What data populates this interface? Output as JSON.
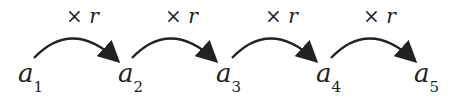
{
  "diagram": {
    "terms": [
      {
        "base": "a",
        "sub": "1"
      },
      {
        "base": "a",
        "sub": "2"
      },
      {
        "base": "a",
        "sub": "3"
      },
      {
        "base": "a",
        "sub": "4"
      },
      {
        "base": "a",
        "sub": "5"
      }
    ],
    "operations": [
      {
        "op": "×",
        "var": "r"
      },
      {
        "op": "×",
        "var": "r"
      },
      {
        "op": "×",
        "var": "r"
      },
      {
        "op": "×",
        "var": "r"
      }
    ],
    "colors": {
      "ink": "#222222",
      "background": "#ffffff"
    }
  }
}
